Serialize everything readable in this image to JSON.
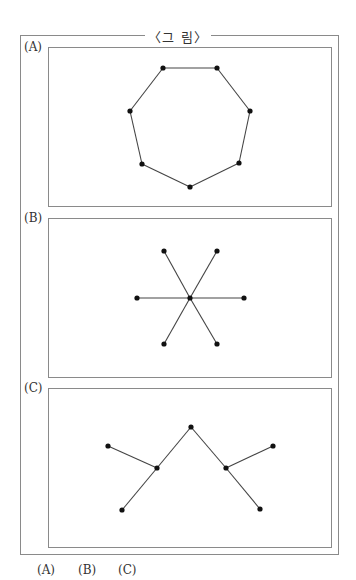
{
  "figure": {
    "title": "〈그   림〉",
    "panels": [
      {
        "label": "(A)",
        "box": {
          "top": 47
        },
        "label_top": 40,
        "shape": "heptagon (cycle of 7 nodes)",
        "nodes": [
          [
            163,
            68
          ],
          [
            217,
            68
          ],
          [
            250,
            111
          ],
          [
            239,
            163
          ],
          [
            190,
            187
          ],
          [
            142,
            164
          ],
          [
            130,
            111
          ]
        ],
        "edges": [
          [
            0,
            1
          ],
          [
            1,
            2
          ],
          [
            2,
            3
          ],
          [
            3,
            4
          ],
          [
            4,
            5
          ],
          [
            5,
            6
          ],
          [
            6,
            0
          ]
        ]
      },
      {
        "label": "(B)",
        "box": {
          "top": 218
        },
        "label_top": 211,
        "shape": "star (1 center, 6 leaves)",
        "nodes": [
          [
            190,
            298
          ],
          [
            164,
            251
          ],
          [
            217,
            251
          ],
          [
            137,
            298
          ],
          [
            244,
            298
          ],
          [
            164,
            344
          ],
          [
            217,
            344
          ]
        ],
        "edges": [
          [
            0,
            1
          ],
          [
            0,
            2
          ],
          [
            0,
            3
          ],
          [
            0,
            4
          ],
          [
            0,
            5
          ],
          [
            0,
            6
          ]
        ]
      },
      {
        "label": "(C)",
        "box": {
          "top": 388
        },
        "label_top": 381,
        "shape": "tree (7 nodes)",
        "nodes": [
          [
            191,
            427
          ],
          [
            157,
            468
          ],
          [
            226,
            468
          ],
          [
            108,
            446
          ],
          [
            122,
            510
          ],
          [
            273,
            446
          ],
          [
            260,
            509
          ]
        ],
        "edges": [
          [
            0,
            1
          ],
          [
            0,
            2
          ],
          [
            1,
            3
          ],
          [
            1,
            4
          ],
          [
            2,
            5
          ],
          [
            2,
            6
          ]
        ]
      }
    ]
  },
  "choices": [
    {
      "label": "(A)",
      "left": 37
    },
    {
      "label": "(B)",
      "left": 78
    },
    {
      "label": "(C)",
      "left": 118
    }
  ],
  "colors": {
    "frame": "#8a8a8a",
    "edge": "#444444",
    "node": "#111111"
  }
}
